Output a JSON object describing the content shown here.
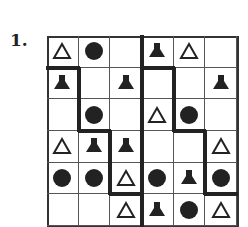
{
  "puzzle": {
    "number": "1.",
    "rows": 6,
    "cols": 6,
    "cells": [
      [
        "triangle",
        "circle",
        "",
        "bell",
        "triangle",
        ""
      ],
      [
        "bell",
        "",
        "bell",
        "",
        "",
        "bell"
      ],
      [
        "",
        "circle",
        "",
        "triangle",
        "circle",
        ""
      ],
      [
        "triangle",
        "bell",
        "bell",
        "",
        "",
        "triangle"
      ],
      [
        "circle",
        "circle",
        "triangle",
        "circle",
        "bell",
        "circle"
      ],
      [
        "",
        "",
        "triangle",
        "bell",
        "circle",
        "triangle"
      ]
    ],
    "thick_borders": [
      {
        "type": "v",
        "x": 3,
        "y0": 0,
        "y1": 6
      },
      {
        "type": "h",
        "y": 1,
        "x0": 0,
        "x1": 1
      },
      {
        "type": "h",
        "y": 1,
        "x0": 3,
        "x1": 4
      },
      {
        "type": "v",
        "x": 1,
        "y0": 1,
        "y1": 3
      },
      {
        "type": "h",
        "y": 3,
        "x0": 1,
        "x1": 2
      },
      {
        "type": "v",
        "x": 2,
        "y0": 3,
        "y1": 5
      },
      {
        "type": "h",
        "y": 5,
        "x0": 2,
        "x1": 3
      },
      {
        "type": "v",
        "x": 4,
        "y0": 1,
        "y1": 3
      },
      {
        "type": "h",
        "y": 3,
        "x0": 4,
        "x1": 5
      },
      {
        "type": "v",
        "x": 5,
        "y0": 3,
        "y1": 5
      },
      {
        "type": "h",
        "y": 5,
        "x0": 5,
        "x1": 6
      }
    ]
  }
}
